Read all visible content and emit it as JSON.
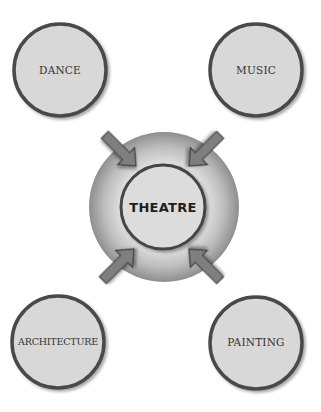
{
  "diagram": {
    "center": {
      "label": "THEATRE"
    },
    "nodes": [
      {
        "id": "dance",
        "label": "DANCE",
        "position": "top-left"
      },
      {
        "id": "music",
        "label": "MUSIC",
        "position": "top-right"
      },
      {
        "id": "architecture",
        "label": "ARCHITECTURE",
        "position": "bottom-left"
      },
      {
        "id": "painting",
        "label": "PAINTING",
        "position": "bottom-right"
      }
    ],
    "edges": [
      {
        "from": "dance",
        "to": "theatre",
        "type": "arrow"
      },
      {
        "from": "music",
        "to": "theatre",
        "type": "arrow"
      },
      {
        "from": "architecture",
        "to": "theatre",
        "type": "arrow"
      },
      {
        "from": "painting",
        "to": "theatre",
        "type": "arrow"
      }
    ],
    "colors": {
      "circle_fill": "#d9d9d9",
      "circle_border": "#4a4a4a",
      "arrow_fill": "#808080",
      "arrow_border": "#3c3c3c",
      "sphere_light": "#f2f2f2",
      "sphere_dark": "#8c8c8c"
    }
  }
}
